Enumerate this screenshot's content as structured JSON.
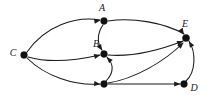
{
  "figure": {
    "kind": "directed-graph-diagram",
    "width": 207,
    "height": 101,
    "background_color": "#ffffff",
    "ink_color": "#1a1a1a"
  },
  "nodes": [
    {
      "id": "C",
      "label": "C",
      "x": 24,
      "y": 55,
      "label_x": 13,
      "label_y": 54,
      "labeled": true,
      "radius": 3.4
    },
    {
      "id": "A",
      "label": "A",
      "x": 104,
      "y": 21,
      "label_x": 102,
      "label_y": 9,
      "labeled": true,
      "radius": 3.4
    },
    {
      "id": "B",
      "label": "B",
      "x": 104,
      "y": 54,
      "label_x": 96,
      "label_y": 45,
      "labeled": true,
      "radius": 3.4
    },
    {
      "id": "F",
      "label": "",
      "x": 104,
      "y": 84,
      "label_x": 0,
      "label_y": 0,
      "labeled": false,
      "radius": 3.4
    },
    {
      "id": "E",
      "label": "E",
      "x": 186,
      "y": 38,
      "label_x": 185,
      "label_y": 25,
      "labeled": true,
      "radius": 3.6
    },
    {
      "id": "D",
      "label": "D",
      "x": 184,
      "y": 84,
      "label_x": 194,
      "label_y": 89,
      "labeled": true,
      "radius": 3.4
    }
  ],
  "edges": [
    {
      "id": "C-A",
      "from": "C",
      "to": "A",
      "path": "M 27 52 C 45 26 75 16 100 20",
      "arrow_at": {
        "x": 100.5,
        "y": 20.2,
        "angle": 350
      }
    },
    {
      "id": "C-B",
      "from": "C",
      "to": "B",
      "path": "M 28 57 C 52 64 78 60 100 55",
      "arrow_at": {
        "x": 100.4,
        "y": 55.0,
        "angle": 346
      }
    },
    {
      "id": "C-F",
      "from": "C",
      "to": "F",
      "path": "M 27 58 C 45 76 74 86 100 84",
      "arrow_at": {
        "x": 100.4,
        "y": 84.2,
        "angle": 6
      }
    },
    {
      "id": "A-E",
      "from": "A",
      "to": "E",
      "path": "M 108 21 C 133 17 165 23 184 34",
      "arrow_at": {
        "x": 184.0,
        "y": 34.4,
        "angle": 56
      }
    },
    {
      "id": "A-B",
      "from": "A",
      "to": "B",
      "path": "M 103 25 C 97 33 97 44 102 50",
      "arrow_at": {
        "x": 102.2,
        "y": 50.6,
        "angle": 58
      }
    },
    {
      "id": "F-B",
      "from": "F",
      "to": "B",
      "path": "M 106 81 C 114 73 114 64 107 57",
      "arrow_at": {
        "x": 106.6,
        "y": 57.2,
        "angle": 225
      }
    },
    {
      "id": "B-E",
      "from": "B",
      "to": "E",
      "path": "M 108 55 C 132 57 160 50 183 41",
      "arrow_at": {
        "x": 183.2,
        "y": 41.0,
        "angle": 338
      }
    },
    {
      "id": "F-E",
      "from": "F",
      "to": "E",
      "path": "M 108 83 C 134 79 164 62 183 43",
      "arrow_at": {
        "x": 183.4,
        "y": 42.6,
        "angle": 315
      }
    },
    {
      "id": "F-D",
      "from": "F",
      "to": "D",
      "path": "M 108 84 C 132 84 158 84 180 84",
      "arrow_at": {
        "x": 180.4,
        "y": 84.0,
        "angle": 0
      }
    },
    {
      "id": "D-E",
      "from": "D",
      "to": "E",
      "path": "M 186 81 C 196 72 196 52 189 41",
      "arrow_at": {
        "x": 188.8,
        "y": 41.2,
        "angle": 238
      }
    }
  ]
}
